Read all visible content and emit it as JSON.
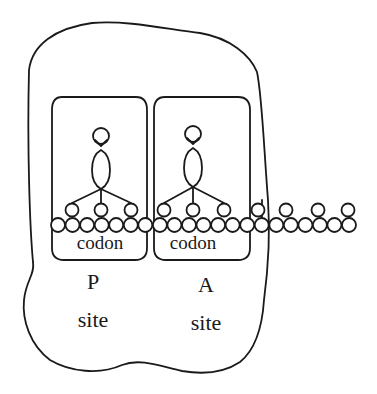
{
  "diagram": {
    "colors": {
      "line": "#1a1a1a",
      "background": "#ffffff"
    },
    "sites": [
      {
        "id": "p",
        "codon_label": "codon",
        "letter": "P",
        "word": "site"
      },
      {
        "id": "a",
        "codon_label": "codon",
        "letter": "A",
        "word": "site"
      }
    ],
    "mrna": {
      "bead_count": 21
    }
  }
}
